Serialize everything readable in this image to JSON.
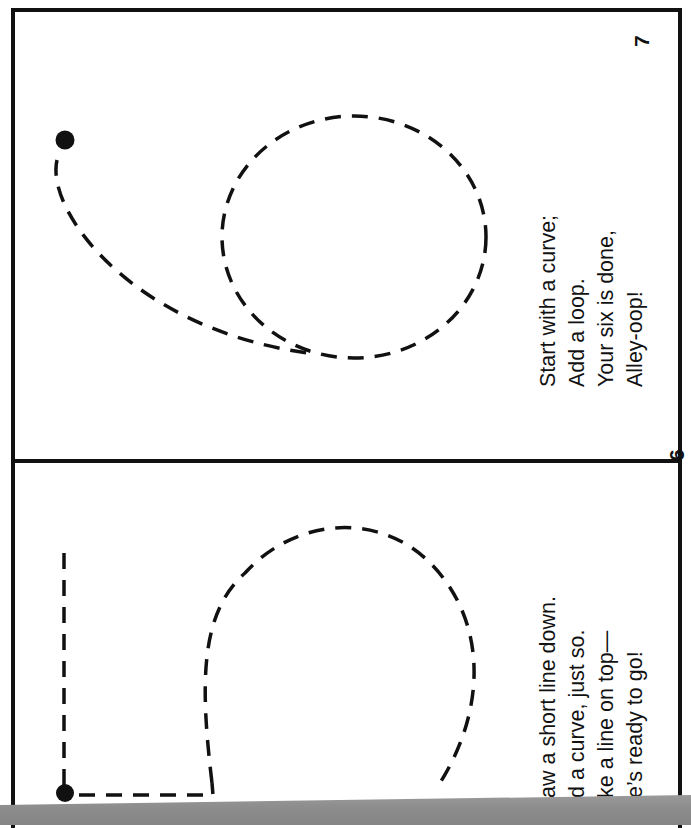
{
  "document": {
    "type": "rotated booklet spread",
    "pages": [
      {
        "page_number": "7",
        "verse": [
          "Start with a curve;",
          "Add a loop.",
          "Your six is done,",
          "Alley-oop!"
        ],
        "tracing_figure": "numeral-6-dashed",
        "start_marker": "filled-dot"
      },
      {
        "page_number": "6",
        "verse": [
          "aw a short line down.",
          "d a curve, just so.",
          "ke a line on top—",
          "e’s ready to go!"
        ],
        "tracing_figure": "numeral-5-dashed",
        "start_marker": "filled-dot"
      }
    ]
  },
  "colors": {
    "ink": "#111111",
    "paper": "#ffffff",
    "shadow": "#8e8e8e"
  }
}
